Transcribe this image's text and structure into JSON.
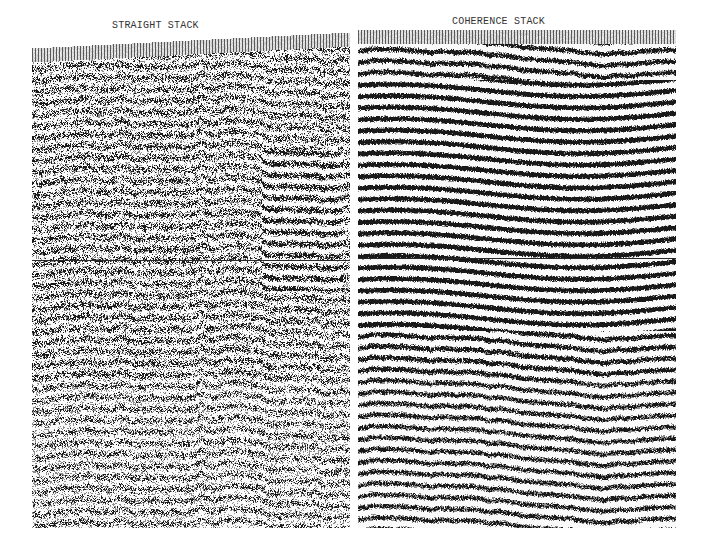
{
  "figure": {
    "panels": [
      {
        "id": "straight",
        "title": "STRAIGHT STACK",
        "x": 32,
        "y_top_left": 48,
        "y_top_right": 32,
        "width": 318,
        "bottom": 528,
        "title_x": 112,
        "title_y": 20,
        "timing_line_y": 260,
        "bright_zone": {
          "x0": 230,
          "x1": 310,
          "y0": 150,
          "y1": 290
        },
        "coherence": 0.35,
        "noise": 0.75
      },
      {
        "id": "coherence",
        "title": "COHERENCE STACK",
        "x": 358,
        "y_top_left": 30,
        "y_top_right": 30,
        "width": 318,
        "bottom": 528,
        "title_x": 452,
        "title_y": 16,
        "timing_line_y": 258,
        "bright_zone": {
          "x0": 0,
          "x1": 318,
          "y0": 80,
          "y1": 330
        },
        "coherence": 0.75,
        "noise": 0.45
      }
    ],
    "colors": {
      "ink": "#1a1a1a",
      "background": "#ffffff"
    }
  }
}
